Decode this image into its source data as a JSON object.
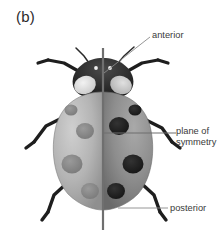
{
  "figure": {
    "panel_label": "(b)",
    "width": 218,
    "height": 230,
    "background_color": "#ffffff"
  },
  "labels": {
    "anterior": "anterior",
    "plane_of_symmetry": "plane of\nsymmetry",
    "posterior": "posterior"
  },
  "colors": {
    "text": "#3a3a3a",
    "panel_text": "#2b2b2b",
    "leader_line": "#8a8a8a",
    "axis_line": "#6f6f6f",
    "elytra_light": "#b5b5b5",
    "elytra_dark": "#8e8e8e",
    "spot_light": "#8d8d8d",
    "spot_dark": "#242424",
    "pronotum": "#2a2a2a",
    "pronotum_patch": "#e2e2e2",
    "leg": "#1e1e1e"
  },
  "anatomy": {
    "spots_left": 4,
    "spots_right": 4,
    "legs": 6,
    "antennae": 2
  }
}
